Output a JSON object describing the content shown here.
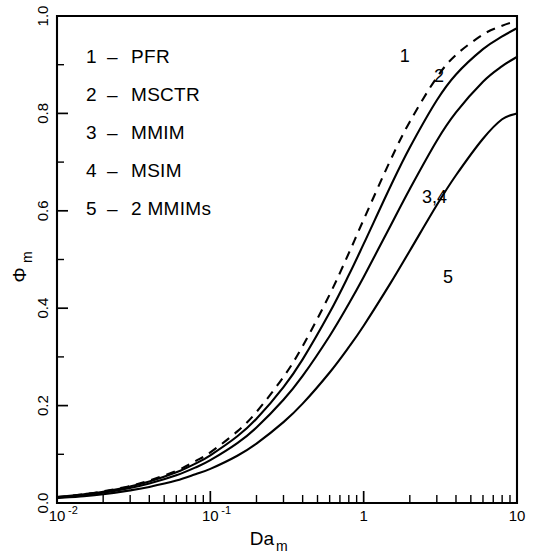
{
  "chart_data": {
    "type": "line",
    "title": "",
    "xlabel": "Da_m",
    "xlabel_base": "Da",
    "xlabel_sub": "m",
    "ylabel": "Φ_m",
    "ylabel_base": "Φ",
    "ylabel_sub": "m",
    "xscale": "log",
    "xlim": [
      0.01,
      10
    ],
    "ylim": [
      0.0,
      1.0
    ],
    "grid": false,
    "legend_position": "upper-left-inside",
    "x_tick_labels": [
      {
        "value": 0.01,
        "mantissa": "10",
        "exponent": "-2"
      },
      {
        "value": 0.1,
        "mantissa": "10",
        "exponent": "-1"
      },
      {
        "value": 1,
        "mantissa": "1",
        "exponent": ""
      },
      {
        "value": 10,
        "mantissa": "10",
        "exponent": ""
      }
    ],
    "y_tick_labels": [
      "0.0",
      "0.2",
      "0.4",
      "0.6",
      "0.8",
      "1.0"
    ],
    "y_tick_values": [
      0.0,
      0.2,
      0.4,
      0.6,
      0.8,
      1.0
    ],
    "y_minor_tick_values": [
      0.1,
      0.3,
      0.5,
      0.7,
      0.9
    ],
    "x": [
      0.01,
      0.015,
      0.02,
      0.03,
      0.04,
      0.06,
      0.08,
      0.1,
      0.15,
      0.2,
      0.3,
      0.4,
      0.6,
      0.8,
      1.0,
      1.5,
      2.0,
      3.0,
      4.0,
      6.0,
      8.0,
      10.0
    ],
    "series": [
      {
        "name": "PFR",
        "curve_number": "1",
        "label": "1",
        "style": "dashed",
        "label_position": {
          "x": 1.85,
          "y": 0.905
        },
        "values": [
          0.012,
          0.018,
          0.024,
          0.035,
          0.046,
          0.066,
          0.086,
          0.104,
          0.147,
          0.187,
          0.259,
          0.322,
          0.428,
          0.513,
          0.582,
          0.705,
          0.783,
          0.874,
          0.92,
          0.962,
          0.98,
          0.99
        ]
      },
      {
        "name": "MSCTR",
        "curve_number": "2",
        "label": "2",
        "style": "solid",
        "label_position": {
          "x": 3.1,
          "y": 0.865
        },
        "values": [
          0.012,
          0.018,
          0.023,
          0.034,
          0.044,
          0.063,
          0.081,
          0.098,
          0.137,
          0.173,
          0.238,
          0.295,
          0.391,
          0.468,
          0.532,
          0.651,
          0.73,
          0.827,
          0.88,
          0.932,
          0.958,
          0.975
        ]
      },
      {
        "name": "MMIM / MSIM",
        "curve_number": "3,4",
        "label": "3,4",
        "style": "solid",
        "label_position": {
          "x": 2.9,
          "y": 0.615
        },
        "values": [
          0.011,
          0.016,
          0.021,
          0.031,
          0.04,
          0.057,
          0.073,
          0.088,
          0.123,
          0.155,
          0.212,
          0.261,
          0.343,
          0.409,
          0.464,
          0.57,
          0.645,
          0.744,
          0.802,
          0.865,
          0.897,
          0.916
        ]
      },
      {
        "name": "2 MMIMs",
        "curve_number": "5",
        "label": "5",
        "style": "solid",
        "label_position": {
          "x": 3.55,
          "y": 0.452
        },
        "values": [
          0.01,
          0.014,
          0.018,
          0.026,
          0.033,
          0.046,
          0.059,
          0.07,
          0.097,
          0.122,
          0.166,
          0.204,
          0.268,
          0.32,
          0.364,
          0.452,
          0.518,
          0.612,
          0.673,
          0.748,
          0.788,
          0.8
        ]
      }
    ]
  },
  "legend": {
    "entries": [
      {
        "number": "1",
        "dash": "–",
        "name": "PFR"
      },
      {
        "number": "2",
        "dash": "–",
        "name": "MSCTR"
      },
      {
        "number": "3",
        "dash": "–",
        "name": "MMIM"
      },
      {
        "number": "4",
        "dash": "–",
        "name": "MSIM"
      },
      {
        "number": "5",
        "dash": "–",
        "name": "2 MMIMs"
      }
    ]
  },
  "colors": {
    "ink": "#000000",
    "background": "#ffffff"
  }
}
